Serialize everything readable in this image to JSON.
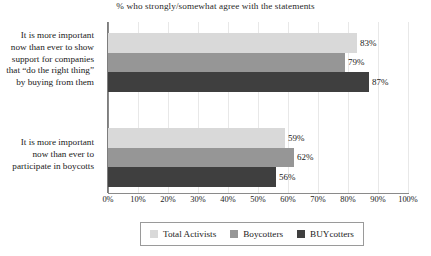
{
  "chart_data": {
    "type": "bar",
    "orientation": "horizontal",
    "title": "% who strongly/somewhat agree with the statements",
    "xlabel": "",
    "ylabel": "",
    "xlim": [
      0,
      100
    ],
    "xtick_labels": [
      "0%",
      "10%",
      "20%",
      "30%",
      "40%",
      "50%",
      "60%",
      "70%",
      "80%",
      "90%",
      "100%"
    ],
    "xtick_values": [
      0,
      10,
      20,
      30,
      40,
      50,
      60,
      70,
      80,
      90,
      100
    ],
    "grid": true,
    "legend_position": "bottom",
    "categories": [
      "It is more important now than ever to show support for companies that “do the right thing” by buying from them",
      "It is more important now than ever to participate in boycotts"
    ],
    "category_lines": [
      [
        "It is more important",
        "now than ever to show",
        "support for companies",
        "that “do the right thing”",
        "by buying from them"
      ],
      [
        "It is more important",
        "now than ever to",
        "participate in boycotts"
      ]
    ],
    "series": [
      {
        "name": "Total Activists",
        "color": "#d9d9d9",
        "values": [
          83,
          79
        ],
        "labels": [
          "83%",
          "59%"
        ]
      },
      {
        "name": "Boycotters",
        "color": "#969696",
        "values": [
          79,
          62
        ],
        "labels": [
          "79%",
          "62%"
        ]
      },
      {
        "name": "BUYcotters",
        "color": "#3f3f3f",
        "values": [
          87,
          56
        ],
        "labels": [
          "87%",
          "56%"
        ]
      }
    ],
    "values_by_group": [
      [
        83,
        79,
        87
      ],
      [
        59,
        62,
        56
      ]
    ],
    "labels_by_group": [
      [
        "83%",
        "79%",
        "87%"
      ],
      [
        "59%",
        "62%",
        "56%"
      ]
    ]
  },
  "legend": {
    "items": [
      {
        "label": "Total Activists",
        "color": "#d9d9d9"
      },
      {
        "label": "Boycotters",
        "color": "#969696"
      },
      {
        "label": "BUYcotters",
        "color": "#3f3f3f"
      }
    ]
  }
}
